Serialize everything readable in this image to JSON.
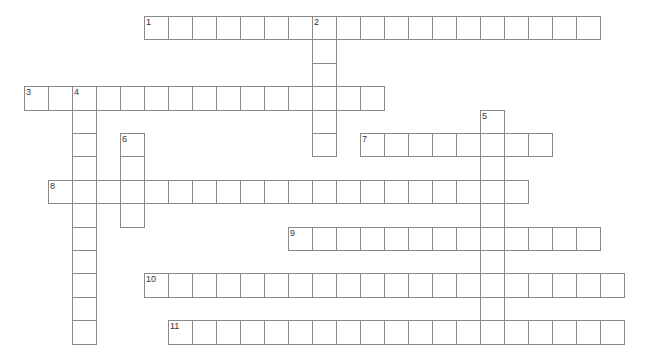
{
  "puzzle": {
    "type": "crossword",
    "grid": {
      "origin_x": 24,
      "origin_y": 16,
      "cell_w": 24,
      "cell_h": 23.4,
      "border_color": "#8a8a8a"
    },
    "entries": [
      {
        "number": "1",
        "direction": "across",
        "row": 0,
        "col": 5,
        "length": 19
      },
      {
        "number": "2",
        "direction": "down",
        "row": 0,
        "col": 12,
        "length": 6
      },
      {
        "number": "3",
        "direction": "across",
        "row": 3,
        "col": 0,
        "length": 15
      },
      {
        "number": "4",
        "direction": "down",
        "row": 3,
        "col": 2,
        "length": 11
      },
      {
        "number": "5",
        "direction": "down",
        "row": 4,
        "col": 19,
        "length": 10
      },
      {
        "number": "6",
        "direction": "down",
        "row": 5,
        "col": 4,
        "length": 4
      },
      {
        "number": "7",
        "direction": "across",
        "row": 5,
        "col": 14,
        "length": 8
      },
      {
        "number": "8",
        "direction": "across",
        "row": 7,
        "col": 1,
        "length": 20
      },
      {
        "number": "9",
        "direction": "across",
        "row": 9,
        "col": 11,
        "length": 13
      },
      {
        "number": "10",
        "direction": "across",
        "row": 11,
        "col": 5,
        "length": 20
      },
      {
        "number": "11",
        "direction": "across",
        "row": 13,
        "col": 6,
        "length": 19
      }
    ]
  }
}
